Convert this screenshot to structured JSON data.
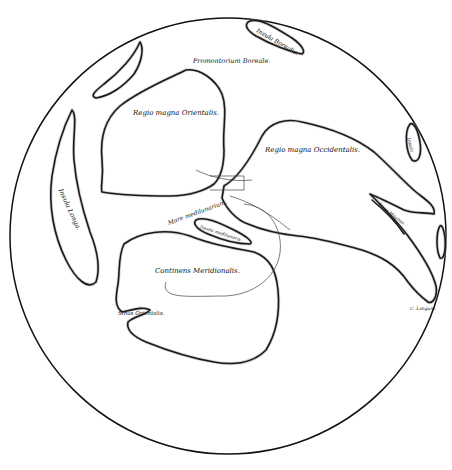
{
  "map": {
    "title": "Lunar map (historical engraving)",
    "style": {
      "ink": "#1a1a1a",
      "paper": "#ffffff"
    },
    "labels": {
      "insula_borealis": "Insula Borealis.",
      "promontorium": "Promontorium Boreale.",
      "regio_orientalis": "Regio magna Orientalis.",
      "regio_occidentalis": "Regio magna Occidentalis.",
      "insula_east": "Insula",
      "insula_longa": "Insula Longa.",
      "mare": "Mare medilunarium.",
      "insula_media": "Insula medilunaris",
      "sinus_magnus": "Sinus Magnus.",
      "continens": "Continens Meridionalis.",
      "sinus_orientalis": "Sinus Orientalis.",
      "cape": "C. Longum."
    }
  }
}
